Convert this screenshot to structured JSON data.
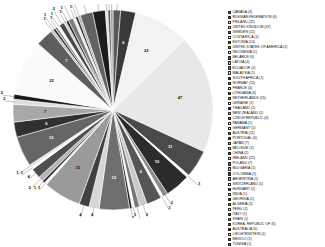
{
  "chart_data": {
    "type": "pie",
    "title": "",
    "subtitle": "",
    "xlabel": "",
    "ylabel": "",
    "legend_position": "right",
    "grid": false,
    "total": 235,
    "categories": [
      "CANADA (3)",
      "RUSSIAN FEDERATION (6)",
      "FINLAND (22)",
      "UNITED KINGDOM (47)",
      "SWEDEN (11)",
      "COSTA RICA (1)",
      "ESTONIA (10)",
      "UNITED STATES OF AMERICA (2)",
      "INDONESIA (1)",
      "BELARUS (6)",
      "LATVIA (3)",
      "ECUADOR (2)",
      "MALAYSIA (1)",
      "SOUTH AFRICA (1)",
      "NORWAY (12)",
      "FRANCE (4)",
      "LITHUANIA (4)",
      "NETHERLANDS (15)",
      "UKRAINE (1)",
      "THAILAND (1)",
      "NEW ZEALAND (2)",
      "CZECH REPUBLIC (4)",
      "PANAMA (1)",
      "GERMANY (1)",
      "AUSTRIA (12)",
      "PORTUGAL (6)",
      "JAPAN (7)",
      "BELGIUM (2)",
      "CHINA (2)",
      "IRELAND (22)",
      "POLAND (7)",
      "BULGARIA (1)",
      "COLOMBIA (1)",
      "ARGENTINA (1)",
      "SWITZERLAND (1)",
      "HUNGARY (2)",
      "INDIA (1)",
      "GEORGIA (1)",
      "ALGERIA (2)",
      "PERU (1)",
      "ITALY (1)",
      "SPAIN (1)",
      "KOREA, REPUBLIC OF (5)",
      "AUSTRALIA (5)",
      "LIECHTENSTEIN (1)",
      "MEXICO (1)",
      "TUNISIA (1)"
    ],
    "labels_short": [
      "CANADA",
      "RUSSIAN FEDERATION",
      "FINLAND",
      "UNITED KINGDOM",
      "SWEDEN",
      "COSTA RICA",
      "ESTONIA",
      "UNITED STATES OF AMERICA",
      "INDONESIA",
      "BELARUS",
      "LATVIA",
      "ECUADOR",
      "MALAYSIA",
      "SOUTH AFRICA",
      "NORWAY",
      "FRANCE",
      "LITHUANIA",
      "NETHERLANDS",
      "UKRAINE",
      "THAILAND",
      "NEW ZEALAND",
      "CZECH REPUBLIC",
      "PANAMA",
      "GERMANY",
      "AUSTRIA",
      "PORTUGAL",
      "JAPAN",
      "BELGIUM",
      "CHINA",
      "IRELAND",
      "POLAND",
      "BULGARIA",
      "COLOMBIA",
      "ARGENTINA",
      "SWITZERLAND",
      "HUNGARY",
      "INDIA",
      "GEORGIA",
      "ALGERIA",
      "PERU",
      "ITALY",
      "SPAIN",
      "KOREA, REPUBLIC OF",
      "AUSTRALIA",
      "LIECHTENSTEIN",
      "MEXICO",
      "TUNISIA"
    ],
    "values": [
      3,
      6,
      22,
      47,
      11,
      1,
      10,
      2,
      1,
      6,
      3,
      2,
      1,
      1,
      12,
      4,
      4,
      15,
      1,
      1,
      2,
      4,
      1,
      1,
      12,
      6,
      7,
      2,
      2,
      22,
      7,
      1,
      1,
      1,
      1,
      2,
      1,
      1,
      2,
      1,
      1,
      1,
      5,
      5,
      1,
      1,
      1
    ],
    "slice_labels": [
      "3",
      "6",
      "22",
      "47",
      "11",
      "1",
      "10",
      "2",
      "1",
      "6",
      "3",
      "2",
      "1",
      "1",
      "12",
      "4",
      "4",
      "15",
      "1",
      "1",
      "2",
      "4",
      "1",
      "1",
      "12",
      "6",
      "7",
      "2",
      "2",
      "22",
      "7",
      "1",
      "1",
      "1",
      "1",
      "2",
      "1",
      "1",
      "2",
      "1",
      "1",
      "1",
      "5",
      "5",
      "1",
      "1",
      "1"
    ],
    "colors": [
      "#595959",
      "#3a3a3a",
      "#f2f2f2",
      "#e8e8e8",
      "#4a4a4a",
      "#ffffff",
      "#2b2b2b",
      "#8a8a8a",
      "#ffffff",
      "#555555",
      "#c9c9c9",
      "#777777",
      "#ffffff",
      "#1e1e1e",
      "#6e6e6e",
      "#d6d6d6",
      "#404040",
      "#9a9a9a",
      "#ffffff",
      "#2b2b2b",
      "#b5b5b5",
      "#4f4f4f",
      "#ffffff",
      "#e0e0e0",
      "#666666",
      "#303030",
      "#a8a8a8",
      "#dedede",
      "#1a1a1a",
      "#fafafa",
      "#5e5e5e",
      "#c2c2c2",
      "#383838",
      "#909090",
      "#ffffff",
      "#484848",
      "#d0d0d0",
      "#262626",
      "#7e7e7e",
      "#ededed",
      "#343434",
      "#b0b0b0",
      "#626262",
      "#1c1c1c",
      "#e4e4e4",
      "#545454",
      "#9e9e9e"
    ]
  },
  "legend": {
    "title": ""
  }
}
